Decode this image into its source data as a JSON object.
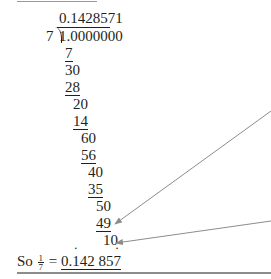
{
  "division": {
    "quotient": "0.1428571",
    "divisor": "7",
    "dividend": "1.0000000",
    "steps": [
      {
        "value": "7",
        "underlined": true
      },
      {
        "value": "30",
        "underlined": false
      },
      {
        "value": "28",
        "underlined": true
      },
      {
        "value": "20",
        "underlined": false
      },
      {
        "value": "14",
        "underlined": true
      },
      {
        "value": "60",
        "underlined": false
      },
      {
        "value": "56",
        "underlined": true
      },
      {
        "value": "40",
        "underlined": false
      },
      {
        "value": "35",
        "underlined": true
      },
      {
        "value": "50",
        "underlined": false
      },
      {
        "value": "49",
        "underlined": true
      },
      {
        "value": "10",
        "underlined": false
      }
    ]
  },
  "conclusion": {
    "prefix": "So",
    "fraction_numerator": "1",
    "fraction_denominator": "7",
    "equals": "=",
    "result_start": "0.",
    "result_dot_first": "1",
    "result_middle": "42 85",
    "result_dot_last": "7"
  },
  "colors": {
    "text": "#231f20",
    "arrow": "#8c8c8c",
    "rule": "#9a9a9a"
  }
}
